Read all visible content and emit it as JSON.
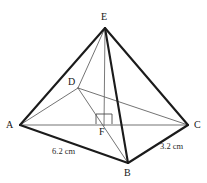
{
  "figure": {
    "canvas": {
      "width": 207,
      "height": 183,
      "background": "#ffffff"
    },
    "colors": {
      "edge_thick": "#1b1b1b",
      "edge_thin": "#5a5a5a",
      "edge_medium": "#3d3d3d",
      "altitude": "#6b6b6b",
      "right_angle": "#4a4a4a",
      "label_text": "#161616",
      "length_text": "#2a2a2a"
    },
    "vertices": [
      {
        "id": "E",
        "label": "E",
        "x": 105,
        "y": 28,
        "label_x": 101,
        "label_y": 12
      },
      {
        "id": "D",
        "label": "D",
        "x": 78,
        "y": 88,
        "label_x": 68,
        "label_y": 77
      },
      {
        "id": "A",
        "label": "A",
        "x": 20,
        "y": 125,
        "label_x": 6,
        "label_y": 120
      },
      {
        "id": "C",
        "label": "C",
        "x": 188,
        "y": 125,
        "label_x": 194,
        "label_y": 120
      },
      {
        "id": "B",
        "label": "B",
        "x": 128,
        "y": 163,
        "label_x": 124,
        "label_y": 168
      },
      {
        "id": "F",
        "label": "F",
        "x": 104,
        "y": 124,
        "label_x": 99,
        "label_y": 127
      }
    ],
    "edges": [
      {
        "from": "A",
        "to": "E",
        "style": "thick",
        "name": "edge-a-e"
      },
      {
        "from": "E",
        "to": "C",
        "style": "thick",
        "name": "edge-e-c"
      },
      {
        "from": "E",
        "to": "B",
        "style": "thick",
        "name": "edge-e-b"
      },
      {
        "from": "A",
        "to": "B",
        "style": "thick",
        "name": "edge-a-b"
      },
      {
        "from": "B",
        "to": "C",
        "style": "thick",
        "name": "edge-b-c"
      },
      {
        "from": "A",
        "to": "C",
        "style": "thin",
        "name": "edge-a-c"
      },
      {
        "from": "A",
        "to": "D",
        "style": "thin",
        "name": "edge-a-d"
      },
      {
        "from": "D",
        "to": "C",
        "style": "thin",
        "name": "edge-d-c"
      },
      {
        "from": "D",
        "to": "E",
        "style": "thin",
        "name": "edge-d-e"
      },
      {
        "from": "D",
        "to": "B",
        "style": "thin",
        "name": "edge-d-b"
      }
    ],
    "altitude": {
      "name": "altitude-e-f",
      "from": "E",
      "to": "F",
      "description": "vertical height from apex E to base point F"
    },
    "right_angle_marker": {
      "name": "right-angle-marker-at-f",
      "x": 96,
      "y": 114,
      "width": 16,
      "height": 10
    },
    "length_labels": [
      {
        "id": "AB",
        "text": "6.2 cm",
        "x": 52,
        "y": 147,
        "name": "length-label-ab"
      },
      {
        "id": "BC",
        "text": "3.2 cm",
        "x": 160,
        "y": 142,
        "name": "length-label-bc"
      }
    ]
  }
}
